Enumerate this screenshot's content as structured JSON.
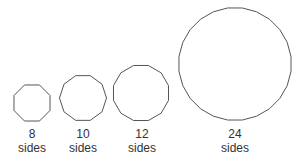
{
  "diagram": {
    "title": "",
    "stroke_color": "#555555",
    "fill_color": "#ffffff",
    "shapes": [
      {
        "sides": 8,
        "number_label": "8",
        "unit_label": "sides",
        "cx": 32,
        "cy": 103,
        "r": 19.5
      },
      {
        "sides": 10,
        "number_label": "10",
        "unit_label": "sides",
        "cx": 83,
        "cy": 98,
        "r": 23.5
      },
      {
        "sides": 12,
        "number_label": "12",
        "unit_label": "sides",
        "cx": 141,
        "cy": 93,
        "r": 28.5
      },
      {
        "sides": 24,
        "number_label": "24",
        "unit_label": "sides",
        "cx": 235,
        "cy": 64,
        "r": 56.5
      }
    ]
  }
}
